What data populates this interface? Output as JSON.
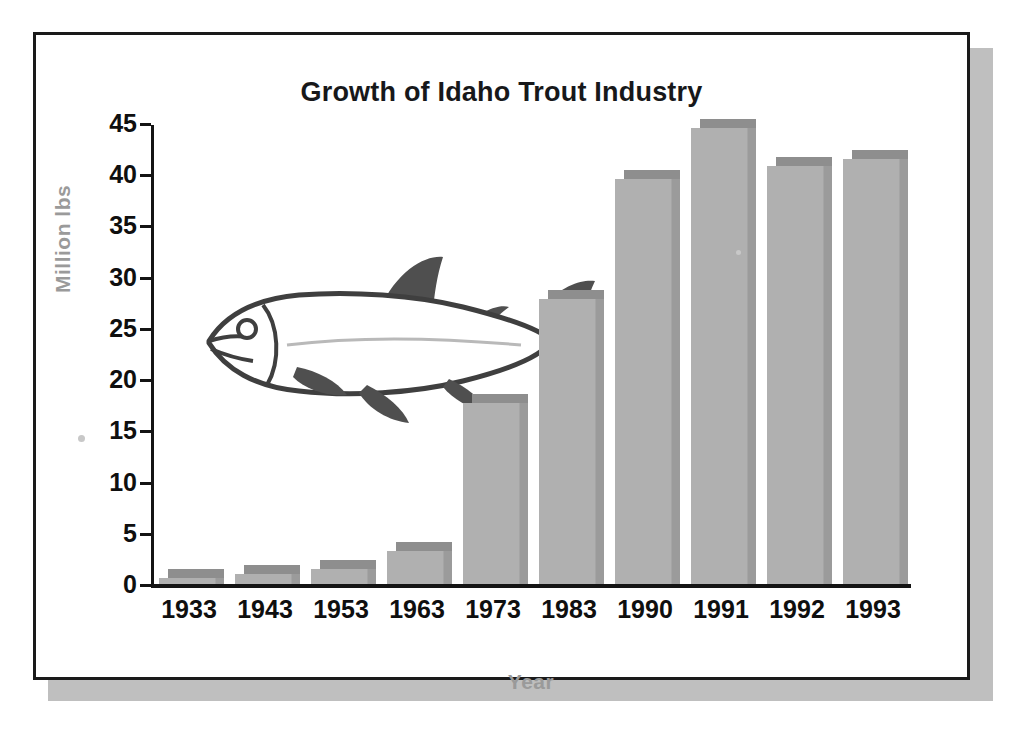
{
  "figure": {
    "title": "Growth of Idaho Trout Industry",
    "frame_color": "#1a1a1a",
    "shadow_color": "#bfbfbf",
    "illustration": "trout-fish-illustration"
  },
  "chart_data": {
    "type": "bar",
    "title": "Growth of Idaho Trout Industry",
    "xlabel": "Year",
    "ylabel": "Million lbs",
    "categories": [
      "1933",
      "1943",
      "1953",
      "1963",
      "1973",
      "1983",
      "1990",
      "1991",
      "1992",
      "1993"
    ],
    "values": [
      0.6,
      1.0,
      1.5,
      3.2,
      17.7,
      27.8,
      39.5,
      44.5,
      40.8,
      41.5
    ],
    "series": [
      {
        "name": "Idaho trout production",
        "values": [
          0.6,
          1.0,
          1.5,
          3.2,
          17.7,
          27.8,
          39.5,
          44.5,
          40.8,
          41.5
        ]
      }
    ],
    "ylim": [
      0,
      45
    ],
    "ytick_values": [
      0,
      5,
      10,
      15,
      20,
      25,
      30,
      35,
      40,
      45
    ],
    "ytick_labels": [
      "0",
      "5",
      "10",
      "15",
      "20",
      "25",
      "30",
      "35",
      "40",
      "45"
    ],
    "grid": false,
    "legend": false,
    "bar_color": "#b0b0b0",
    "bar_top_color": "#8e8e8e",
    "bar_side_color": "#9b9b9b",
    "axis_label_color": "#9a9a9a",
    "tick_label_color": "#0f0f0f"
  }
}
